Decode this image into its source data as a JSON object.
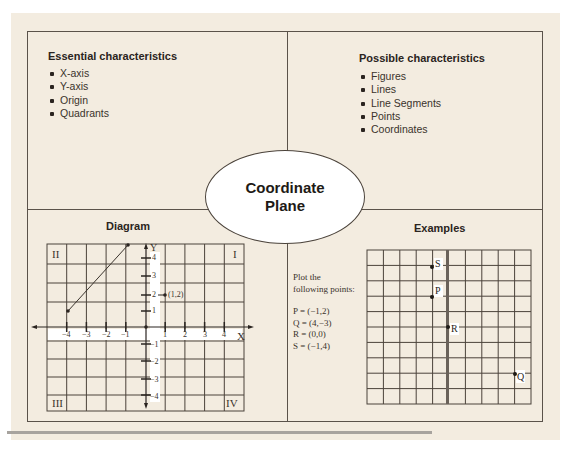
{
  "essential": {
    "title": "Essential characteristics",
    "items": [
      "X-axis",
      "Y-axis",
      "Origin",
      "Quadrants"
    ]
  },
  "possible": {
    "title": "Possible characteristics",
    "items": [
      "Figures",
      "Lines",
      "Line Segments",
      "Points",
      "Coordinates"
    ]
  },
  "center": {
    "line1": "Coordinate",
    "line2": "Plane"
  },
  "diagram": {
    "title": "Diagram",
    "quadrants": {
      "q1": "I",
      "q2": "II",
      "q3": "III",
      "q4": "IV"
    },
    "x_axis_label": "X",
    "y_axis_label": "Y",
    "x_ticks": [
      "−4",
      "−3",
      "−2",
      "−1",
      "1",
      "2",
      "3",
      "4"
    ],
    "y_ticks": [
      "4",
      "3",
      "2",
      "1",
      "−1",
      "−2",
      "−3",
      "−4"
    ],
    "point_label": "(1,2)",
    "segment": {
      "from": [
        -4,
        1
      ],
      "to": [
        -1,
        4
      ]
    }
  },
  "examples": {
    "title": "Examples",
    "instructions_line1": "Plot the",
    "instructions_line2": "following points:",
    "points": [
      {
        "name": "P",
        "text": "P = (−1,2)",
        "x": -1,
        "y": 2
      },
      {
        "name": "Q",
        "text": "Q = (4,−3)",
        "x": 4,
        "y": -3
      },
      {
        "name": "R",
        "text": "R = (0,0)",
        "x": 0,
        "y": 0
      },
      {
        "name": "S",
        "text": "S = (−1,4)",
        "x": -1,
        "y": 4
      }
    ]
  },
  "colors": {
    "page_background": "#f3ece0",
    "border": "#5a524a",
    "text": "#2a2420",
    "ellipse_fill": "#ffffff"
  }
}
